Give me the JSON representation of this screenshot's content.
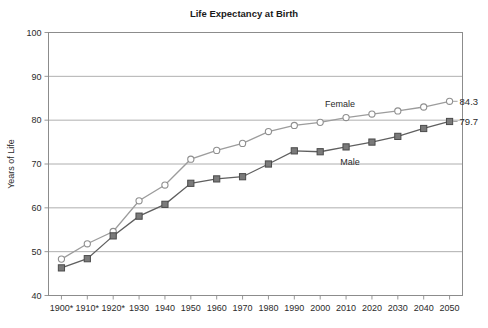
{
  "chart_data": {
    "type": "line",
    "title": "Life Expectancy at Birth",
    "xlabel": "",
    "ylabel": "Years of Life",
    "categories": [
      "1900*",
      "1910*",
      "1920*",
      "1930",
      "1940",
      "1950",
      "1960",
      "1970",
      "1980",
      "1990",
      "2000",
      "2010",
      "2020",
      "2030",
      "2040",
      "2050"
    ],
    "series": [
      {
        "name": "Female",
        "marker": "open-circle",
        "color": "#9c9c9c",
        "values": [
          48.3,
          51.8,
          54.6,
          61.6,
          65.2,
          71.1,
          73.1,
          74.7,
          77.4,
          78.8,
          79.5,
          80.6,
          81.4,
          82.1,
          83.0,
          84.3
        ],
        "end_label": "84.3",
        "label_text": "Female"
      },
      {
        "name": "Male",
        "marker": "filled-square",
        "color": "#5f5f5f",
        "values": [
          46.3,
          48.4,
          53.6,
          58.1,
          60.8,
          65.6,
          66.6,
          67.1,
          70.0,
          73.0,
          72.8,
          73.9,
          75.0,
          76.3,
          78.1,
          79.7
        ],
        "end_label": "79.7",
        "label_text": "Male"
      }
    ],
    "ylim": [
      40,
      100
    ],
    "yticks": [
      40,
      50,
      60,
      70,
      80,
      90,
      100
    ],
    "ytick_labels": [
      "40",
      "50",
      "60",
      "70",
      "80",
      "90",
      "100"
    ],
    "grid": true,
    "legend_position": "inline-annotations"
  }
}
